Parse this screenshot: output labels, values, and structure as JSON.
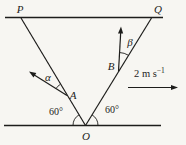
{
  "diagram": {
    "labels": {
      "p": "P",
      "q": "Q",
      "o": "O",
      "a": "A",
      "b": "B"
    },
    "angle_labels": {
      "alpha": "α",
      "beta": "β",
      "angle_left": "60°",
      "angle_right": "60°"
    },
    "velocity_label": {
      "base": "2 m s",
      "exponent": "−1"
    },
    "colors": {
      "line": "#1d1d1b",
      "text": "#1d1d1b",
      "background": "#f7f6f2"
    }
  }
}
